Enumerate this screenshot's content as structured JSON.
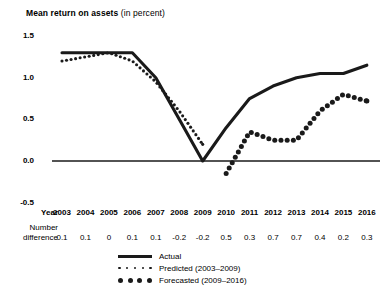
{
  "title": {
    "strong": "Mean return on assets",
    "light": " (in percent)"
  },
  "axis": {
    "y_ticks": [
      "1.5",
      "1.0",
      "0.5",
      "0.0",
      "-0.5"
    ],
    "year_row_label": "Year",
    "diff_row_label_line1": "Number",
    "diff_row_label_line2": "difference"
  },
  "legend": {
    "items": [
      {
        "key": "actual",
        "label": "Actual",
        "style": "solid"
      },
      {
        "key": "predicted",
        "label": "Predicted (2003–2009)",
        "style": "dots-small"
      },
      {
        "key": "forecasted",
        "label": "Forecasted (2009–2016)",
        "style": "dots-big"
      }
    ]
  },
  "colors": {
    "ink": "#1a1a1a",
    "background": "#ffffff"
  },
  "chart_data": {
    "type": "line",
    "title": "Mean return on assets (in percent)",
    "xlabel": "Year",
    "ylabel": "Mean return on assets (in percent)",
    "ylim": [
      -0.5,
      1.5
    ],
    "yticks": [
      -0.5,
      0.0,
      0.5,
      1.0,
      1.5
    ],
    "grid": false,
    "legend_position": "bottom",
    "categories": [
      2003,
      2004,
      2005,
      2006,
      2007,
      2008,
      2009,
      2010,
      2011,
      2012,
      2013,
      2014,
      2015,
      2016
    ],
    "series": [
      {
        "name": "Actual",
        "style": "solid",
        "x": [
          2003,
          2004,
          2005,
          2006,
          2007,
          2008,
          2009,
          2010,
          2011,
          2012,
          2013,
          2014,
          2015,
          2016
        ],
        "values": [
          1.3,
          1.3,
          1.3,
          1.3,
          1.0,
          0.5,
          0.0,
          0.4,
          0.75,
          0.9,
          1.0,
          1.05,
          1.05,
          1.15
        ]
      },
      {
        "name": "Predicted (2003–2009)",
        "style": "dotted-small",
        "x": [
          2003,
          2004,
          2005,
          2006,
          2007,
          2008,
          2009
        ],
        "values": [
          1.2,
          1.25,
          1.3,
          1.2,
          0.95,
          0.6,
          0.2
        ]
      },
      {
        "name": "Forecasted (2009–2016)",
        "style": "dotted-large",
        "x": [
          2010,
          2011,
          2012,
          2013,
          2014,
          2015,
          2016
        ],
        "values": [
          -0.15,
          0.35,
          0.25,
          0.25,
          0.6,
          0.8,
          0.72
        ]
      }
    ],
    "number_difference": {
      "label": "Number difference",
      "x": [
        2003,
        2004,
        2005,
        2006,
        2007,
        2008,
        2009,
        2010,
        2011,
        2012,
        2013,
        2014,
        2015,
        2016
      ],
      "values": [
        "0.1",
        "0.1",
        "0",
        "0.1",
        "0.1",
        "-0.2",
        "-0.2",
        "0.5",
        "0.3",
        "0.7",
        "0.7",
        "0.4",
        "0.2",
        "0.3"
      ]
    }
  }
}
